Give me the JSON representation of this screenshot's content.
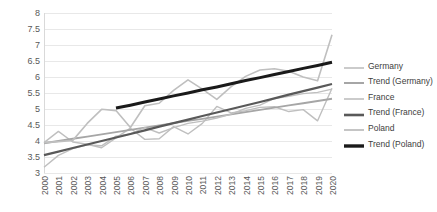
{
  "chart_data": {
    "type": "line",
    "title": "",
    "subtitle": "",
    "xlabel": "",
    "ylabel": "",
    "grid": "horizontal",
    "legend_position": "right",
    "ylim": [
      3,
      8
    ],
    "ytick_step": 0.5,
    "ytick_labels": [
      "8",
      "7.5",
      "7",
      "6.5",
      "6",
      "5.5",
      "5",
      "4.5",
      "4",
      "3.5",
      "3"
    ],
    "ytick_values": [
      8,
      7.5,
      7,
      6.5,
      6,
      5.5,
      5,
      4.5,
      4,
      3.5,
      3
    ],
    "categories": [
      "2000",
      "2001",
      "2002",
      "2003",
      "2004",
      "2005",
      "2006",
      "2007",
      "2008",
      "2009",
      "2010",
      "2011",
      "2012",
      "2013",
      "2014",
      "2015",
      "2016",
      "2017",
      "2018",
      "2019",
      "2020"
    ],
    "x": [
      2000,
      2001,
      2002,
      2003,
      2004,
      2005,
      2006,
      2007,
      2008,
      2009,
      2010,
      2011,
      2012,
      2013,
      2014,
      2015,
      2016,
      2017,
      2018,
      2019,
      2020
    ],
    "series": [
      {
        "name": "Germany",
        "type": "data",
        "color": "#bfbfbf",
        "width": 1.4,
        "values": [
          3.95,
          4.3,
          3.97,
          3.9,
          3.79,
          4.1,
          4.4,
          4.05,
          4.07,
          4.45,
          4.22,
          4.55,
          5.08,
          4.88,
          4.95,
          5.05,
          5.07,
          4.92,
          4.98,
          4.63,
          5.65
        ]
      },
      {
        "name": "Trend (Germany)",
        "type": "trend",
        "color": "#a6a6a6",
        "width": 1.8,
        "start_value": 3.93,
        "end_value": 5.32,
        "values": [
          3.93,
          4.0,
          4.07,
          4.14,
          4.21,
          4.28,
          4.35,
          4.42,
          4.49,
          4.56,
          4.63,
          4.69,
          4.76,
          4.83,
          4.9,
          4.97,
          5.04,
          5.11,
          5.18,
          5.25,
          5.32
        ]
      },
      {
        "name": "France",
        "type": "data",
        "color": "#bfbfbf",
        "width": 1.4,
        "values": [
          3.18,
          3.55,
          3.76,
          3.88,
          3.85,
          4.15,
          4.22,
          4.42,
          4.25,
          4.42,
          4.55,
          4.62,
          4.72,
          4.84,
          5.02,
          5.12,
          5.33,
          5.4,
          5.48,
          5.52,
          5.62
        ]
      },
      {
        "name": "Trend (France)",
        "type": "trend",
        "color": "#595959",
        "width": 2.2,
        "start_value": 3.56,
        "end_value": 5.78,
        "values": [
          3.56,
          3.67,
          3.78,
          3.89,
          4.0,
          4.11,
          4.22,
          4.33,
          4.45,
          4.56,
          4.67,
          4.78,
          4.89,
          5.0,
          5.11,
          5.22,
          5.33,
          5.45,
          5.56,
          5.67,
          5.78
        ]
      },
      {
        "name": "Poland",
        "type": "data",
        "color": "#bfbfbf",
        "width": 1.6,
        "values": [
          3.95,
          3.98,
          4.02,
          4.55,
          4.99,
          4.95,
          4.42,
          5.1,
          5.18,
          5.58,
          5.91,
          5.62,
          5.3,
          5.7,
          6.02,
          6.22,
          6.26,
          6.18,
          6.0,
          5.88,
          7.32
        ]
      },
      {
        "name": "Trend (Poland)",
        "type": "trend",
        "color": "#1a1a1a",
        "width": 3,
        "start_year": 2005,
        "end_year": 2020,
        "start_value": 5.03,
        "end_value": 6.46,
        "values": [
          null,
          null,
          null,
          null,
          null,
          5.03,
          5.12,
          5.22,
          5.31,
          5.41,
          5.5,
          5.6,
          5.69,
          5.79,
          5.89,
          5.98,
          6.08,
          6.17,
          6.27,
          6.36,
          6.46
        ]
      }
    ],
    "legend_entries": [
      {
        "label": "Germany",
        "color": "#bfbfbf",
        "width": 1.6
      },
      {
        "label": "Trend (Germany)",
        "color": "#a6a6a6",
        "width": 2
      },
      {
        "label": "France",
        "color": "#bfbfbf",
        "width": 1.6
      },
      {
        "label": "Trend (France)",
        "color": "#595959",
        "width": 2.6
      },
      {
        "label": "Poland",
        "color": "#bfbfbf",
        "width": 1.8
      },
      {
        "label": "Trend (Poland)",
        "color": "#1a1a1a",
        "width": 3.4
      }
    ]
  },
  "style": {
    "background": "#ffffff",
    "gridline_color": "#e8e8e8",
    "axis_text_color": "#595959",
    "legend_text_color": "#404040"
  }
}
